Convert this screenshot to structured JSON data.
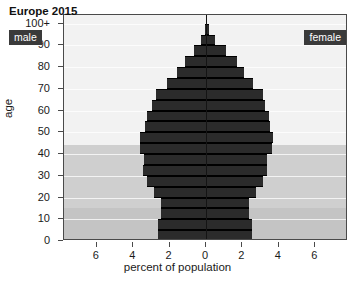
{
  "chart_data": {
    "type": "bar",
    "subtype": "population-pyramid",
    "title": "Europe 2015",
    "xlabel": "percent of population",
    "ylabel": "age",
    "xlim": [
      -7.8,
      7.8
    ],
    "ylim": [
      0,
      104
    ],
    "grid": true,
    "legend_position": "inside-top-corners",
    "x_tick_labels": [
      "6",
      "4",
      "2",
      "0",
      "2",
      "4",
      "6"
    ],
    "x_tick_values": [
      -6,
      -4,
      -2,
      0,
      2,
      4,
      6
    ],
    "y_tick_labels": [
      "0",
      "10",
      "20",
      "30",
      "40",
      "50",
      "60",
      "70",
      "80",
      "90",
      "100+"
    ],
    "y_tick_values": [
      0,
      10,
      20,
      30,
      40,
      50,
      60,
      70,
      80,
      90,
      100
    ],
    "series": [
      {
        "name": "male",
        "side": "left",
        "color": "#2b2b2b"
      },
      {
        "name": "female",
        "side": "right",
        "color": "#2b2b2b"
      }
    ],
    "age_groups": [
      "0-4",
      "5-9",
      "10-14",
      "15-19",
      "20-24",
      "25-29",
      "30-34",
      "35-39",
      "40-44",
      "45-49",
      "50-54",
      "55-59",
      "60-64",
      "65-69",
      "70-74",
      "75-79",
      "80-84",
      "85-89",
      "90-94",
      "95-99",
      "100+"
    ],
    "male_values": [
      2.65,
      2.65,
      2.45,
      2.45,
      2.85,
      3.25,
      3.45,
      3.4,
      3.6,
      3.6,
      3.35,
      3.25,
      2.95,
      2.75,
      2.15,
      1.6,
      1.15,
      0.65,
      0.25,
      0.07,
      0.02
    ],
    "female_values": [
      2.5,
      2.5,
      2.35,
      2.35,
      2.75,
      3.15,
      3.35,
      3.35,
      3.6,
      3.7,
      3.5,
      3.45,
      3.25,
      3.15,
      2.6,
      2.1,
      1.7,
      1.1,
      0.5,
      0.15,
      0.04
    ],
    "bands": [
      {
        "label": "children",
        "from": 0,
        "to": 15,
        "color": "#c4c4c4"
      },
      {
        "label": "working-age",
        "from": 15,
        "to": 44,
        "color": "#cfcfcf"
      },
      {
        "label": "older",
        "from": 44,
        "to": 104,
        "color": "#f2f2f2"
      }
    ],
    "colors": {
      "bar": "#2b2b2b",
      "axis": "#141414",
      "frame": "#4a4a4a",
      "badge_background": "#3a3a3a",
      "badge_text": "#ffffff"
    }
  },
  "annotations": {
    "title": "Europe 2015",
    "male_badge": "male",
    "female_badge": "female"
  }
}
